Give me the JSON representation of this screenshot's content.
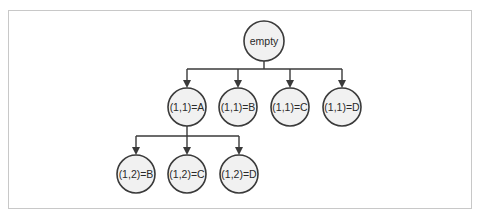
{
  "diagram": {
    "type": "tree",
    "root": {
      "label": "empty"
    },
    "level1": [
      {
        "label": "(1,1)=A"
      },
      {
        "label": "(1,1)=B"
      },
      {
        "label": "(1,1)=C"
      },
      {
        "label": "(1,1)=D"
      }
    ],
    "level2": [
      {
        "label": "(1,2)=B",
        "parent": "(1,1)=A"
      },
      {
        "label": "(1,2)=C",
        "parent": "(1,1)=A"
      },
      {
        "label": "(1,2)=D",
        "parent": "(1,1)=A"
      }
    ],
    "colors": {
      "node_fill": "#f1f1f1",
      "node_stroke": "#3a3a3a",
      "frame": "#c8c8c8"
    }
  }
}
